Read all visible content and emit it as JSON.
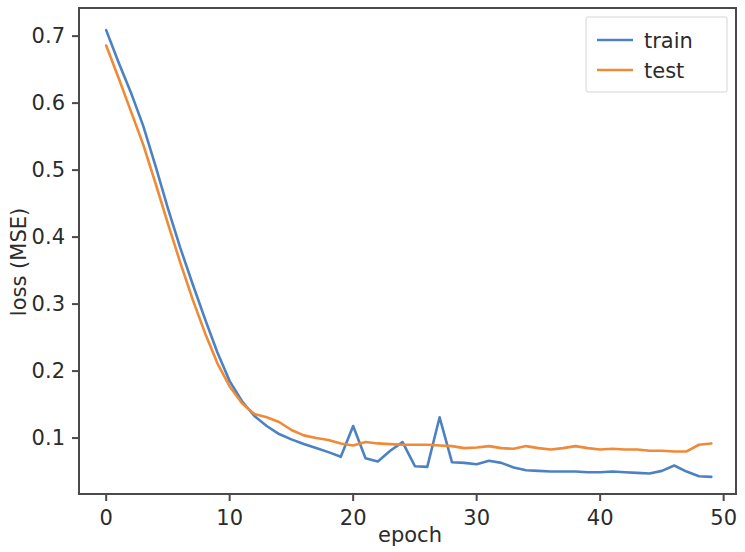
{
  "chart_data": {
    "type": "line",
    "title": "",
    "xlabel": "epoch",
    "ylabel": "loss (MSE)",
    "xlim": [
      -2.2,
      51.0
    ],
    "ylim": [
      0.0165,
      0.742
    ],
    "xticks": [
      0,
      10,
      20,
      30,
      40,
      50
    ],
    "xtick_labels": [
      "0",
      "10",
      "20",
      "30",
      "40",
      "50"
    ],
    "yticks": [
      0.1,
      0.2,
      0.3,
      0.4,
      0.5,
      0.6,
      0.7
    ],
    "ytick_labels": [
      "0.1",
      "0.2",
      "0.3",
      "0.4",
      "0.5",
      "0.6",
      "0.7"
    ],
    "grid": false,
    "legend_position": "upper right",
    "x": [
      0,
      1,
      2,
      3,
      4,
      5,
      6,
      7,
      8,
      9,
      10,
      11,
      12,
      13,
      14,
      15,
      16,
      17,
      18,
      19,
      20,
      21,
      22,
      23,
      24,
      25,
      26,
      27,
      28,
      29,
      30,
      31,
      32,
      33,
      34,
      35,
      36,
      37,
      38,
      39,
      40,
      41,
      42,
      43,
      44,
      45,
      46,
      47,
      48,
      49
    ],
    "series": [
      {
        "name": "train",
        "color": "#4c82c3",
        "values": [
          0.709,
          0.661,
          0.616,
          0.566,
          0.506,
          0.443,
          0.384,
          0.33,
          0.278,
          0.228,
          0.185,
          0.155,
          0.133,
          0.118,
          0.106,
          0.098,
          0.091,
          0.085,
          0.079,
          0.072,
          0.118,
          0.07,
          0.065,
          0.081,
          0.094,
          0.058,
          0.057,
          0.131,
          0.064,
          0.063,
          0.061,
          0.066,
          0.063,
          0.056,
          0.052,
          0.051,
          0.05,
          0.05,
          0.05,
          0.049,
          0.049,
          0.05,
          0.049,
          0.048,
          0.047,
          0.051,
          0.059,
          0.05,
          0.043,
          0.042
        ]
      },
      {
        "name": "test",
        "color": "#f08a36",
        "values": [
          0.686,
          0.638,
          0.588,
          0.538,
          0.48,
          0.42,
          0.362,
          0.307,
          0.257,
          0.212,
          0.177,
          0.152,
          0.136,
          0.131,
          0.124,
          0.112,
          0.104,
          0.1,
          0.097,
          0.092,
          0.089,
          0.094,
          0.092,
          0.091,
          0.09,
          0.09,
          0.09,
          0.089,
          0.088,
          0.085,
          0.086,
          0.088,
          0.085,
          0.084,
          0.088,
          0.085,
          0.083,
          0.085,
          0.088,
          0.085,
          0.083,
          0.084,
          0.083,
          0.083,
          0.081,
          0.081,
          0.08,
          0.08,
          0.09,
          0.092
        ]
      }
    ]
  },
  "legend": {
    "entries": [
      {
        "label": "train",
        "color": "#4c82c3"
      },
      {
        "label": "test",
        "color": "#f08a36"
      }
    ]
  },
  "axes": {
    "x_title": "epoch",
    "y_title": "loss (MSE)"
  }
}
